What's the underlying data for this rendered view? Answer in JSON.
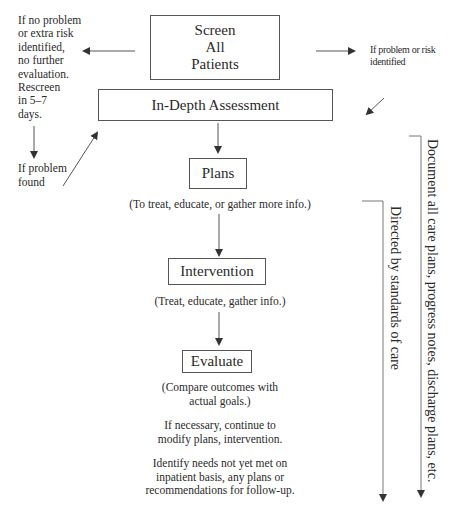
{
  "diagram": {
    "screen_box": {
      "lines": [
        "Screen",
        "All",
        "Patients"
      ]
    },
    "assessment_box": {
      "label": "In-Depth Assessment"
    },
    "plans_box": {
      "label": "Plans"
    },
    "plans_note": "(To treat, educate, or gather more info.)",
    "intervention_box": {
      "label": "Intervention"
    },
    "intervention_note": "(Treat, educate, gather info.)",
    "evaluate_box": {
      "label": "Evaluate"
    },
    "evaluate_notes": [
      [
        "(Compare outcomes with",
        "actual goals.)"
      ],
      [
        "If necessary, continue to",
        "modify plans, intervention."
      ],
      [
        "Identify needs not yet met on",
        "inpatient basis, any plans or",
        "recommendations for follow-up."
      ]
    ],
    "left_note": [
      "If no problem",
      "or extra risk",
      "identified,",
      "no further",
      "evaluation.",
      "Rescreen",
      "in 5–7",
      "days."
    ],
    "left_problem_note": [
      "If problem",
      "found"
    ],
    "right_note": [
      "If problem or risk",
      "identified"
    ],
    "side_labels": {
      "standards": "Directed by standards of care",
      "documentation": "Document all care plans, progress notes, discharge plans, etc."
    },
    "colors": {
      "line": "#555555",
      "text": "#2a2a2a",
      "background": "#ffffff"
    }
  }
}
